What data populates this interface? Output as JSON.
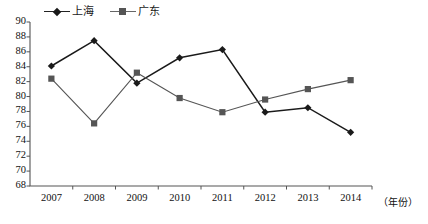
{
  "chart_data": {
    "type": "line",
    "title": "",
    "xlabel": "（年份）",
    "ylabel": "",
    "x": [
      "2007",
      "2008",
      "2009",
      "2010",
      "2011",
      "2012",
      "2013",
      "2014"
    ],
    "categories": [
      "2007",
      "2008",
      "2009",
      "2010",
      "2011",
      "2012",
      "2013",
      "2014"
    ],
    "ylim": [
      68,
      90
    ],
    "y_ticks": [
      68,
      70,
      72,
      74,
      76,
      78,
      80,
      82,
      84,
      86,
      88,
      90
    ],
    "grid": false,
    "legend_position": "top-left",
    "series": [
      {
        "name": "上海",
        "marker": "diamond",
        "color": "#1a1a1a",
        "values": [
          84.1,
          87.5,
          81.8,
          85.2,
          86.3,
          77.9,
          78.5,
          75.2
        ]
      },
      {
        "name": "广东",
        "marker": "square",
        "color": "#555555",
        "values": [
          82.4,
          76.4,
          83.2,
          79.8,
          77.9,
          79.6,
          81.0,
          82.2
        ]
      }
    ]
  },
  "legend": {
    "items": [
      {
        "label": "上海",
        "marker": "diamond-marker"
      },
      {
        "label": "广东",
        "marker": "square-marker"
      }
    ]
  },
  "axes": {
    "y_unit": "",
    "x_unit": "（年份）"
  }
}
